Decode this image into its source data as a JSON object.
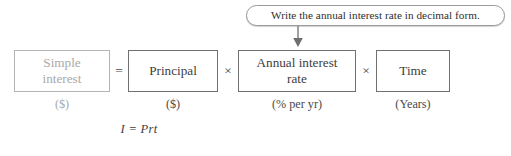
{
  "callout": {
    "text": "Write the annual interest rate in decimal form.",
    "arrow_icon": "down-arrow-icon",
    "border_color": "#9a9a9a"
  },
  "equation": {
    "terms": [
      {
        "label": "Simple\ninterest",
        "unit": "($)",
        "muted": true
      },
      {
        "label": "Principal",
        "unit": "($)",
        "muted": false
      },
      {
        "label": "Annual interest\nrate",
        "unit": "(% per yr)",
        "muted": false
      },
      {
        "label": "Time",
        "unit": "(Years)",
        "muted": false
      }
    ],
    "operators": [
      "=",
      "×",
      "×"
    ],
    "formula": "I = Prt"
  },
  "colors": {
    "box_border": "#6f6f6f",
    "box_border_muted": "#b4b4b4",
    "text": "#3d3d3d",
    "text_muted": "#a9a9a9",
    "background": "#ffffff"
  }
}
